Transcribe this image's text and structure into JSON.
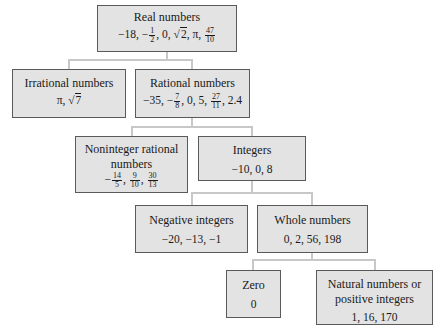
{
  "diagram": {
    "type": "tree",
    "nodes": {
      "real": {
        "title": "Real numbers",
        "examples": [
          "−18",
          "−1/2",
          "0",
          "√2",
          "π",
          "47/10"
        ]
      },
      "irrational": {
        "title": "Irrational numbers",
        "examples": [
          "π",
          "√7"
        ]
      },
      "rational": {
        "title": "Rational numbers",
        "examples": [
          "−35",
          "−7/8",
          "0",
          "5",
          "27/11",
          "2.4"
        ]
      },
      "noninteger": {
        "title_line1": "Noninteger rational",
        "title_line2": "numbers",
        "examples": [
          "−14/5",
          "9/10",
          "30/13"
        ]
      },
      "integers": {
        "title": "Integers",
        "examples_text": "−10, 0, 8"
      },
      "negative": {
        "title": "Negative integers",
        "examples_text": "−20, −13, −1"
      },
      "whole": {
        "title": "Whole numbers",
        "examples_text": "0, 2, 56, 198"
      },
      "zero": {
        "title": "Zero",
        "examples_text": "0"
      },
      "natural": {
        "title_line1": "Natural numbers or",
        "title_line2": "positive integers",
        "examples_text": "1, 16, 170"
      }
    },
    "edges": [
      [
        "real",
        "irrational"
      ],
      [
        "real",
        "rational"
      ],
      [
        "rational",
        "noninteger"
      ],
      [
        "rational",
        "integers"
      ],
      [
        "integers",
        "negative"
      ],
      [
        "integers",
        "whole"
      ],
      [
        "whole",
        "zero"
      ],
      [
        "whole",
        "natural"
      ]
    ],
    "glyphs": {
      "minus": "−",
      "pi": "π",
      "sqrt": "√",
      "comma": ", ",
      "n18": "18",
      "n1": "1",
      "n2": "2",
      "n0": "0",
      "n47": "47",
      "n10": "10",
      "n7": "7",
      "n35": "35",
      "n8": "8",
      "n5": "5",
      "n27": "27",
      "n11": "11",
      "d24": "2.4",
      "n14": "14",
      "n9": "9",
      "n30": "30",
      "n13": "13"
    }
  }
}
